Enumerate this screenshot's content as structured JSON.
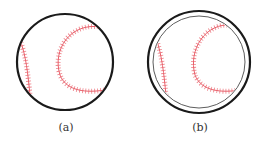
{
  "figures": [
    {
      "label": "(a)",
      "cx": 65,
      "cy": 62,
      "outer_r": 48,
      "inner_r": null
    },
    {
      "label": "(b)",
      "cx": 199,
      "cy": 62,
      "outer_r": 51,
      "inner_r": 46
    }
  ],
  "colors": {
    "outline": "#1a1a1a",
    "stitch": "#e8606a"
  }
}
